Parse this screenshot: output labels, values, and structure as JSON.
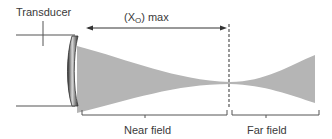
{
  "diagram": {
    "labels": {
      "transducer": "Transducer",
      "near_field_length": "(X",
      "near_field_length_subscript": "O",
      "near_field_length_suffix": ") max",
      "near_field": "Near field",
      "far_field": "Far field"
    },
    "colors": {
      "beam": "#b4b4b4",
      "lines": "#555555",
      "text": "#3a3a3a",
      "transducer_face": "#4a4a4a"
    }
  }
}
